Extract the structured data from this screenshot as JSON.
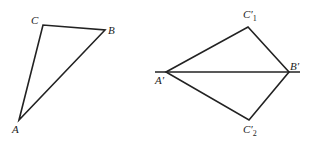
{
  "diagram": {
    "left_triangle": {
      "vertices": {
        "A": {
          "label": "A",
          "x": 19,
          "y": 120
        },
        "B": {
          "label": "B",
          "x": 105,
          "y": 30
        },
        "C": {
          "label": "C",
          "x": 43,
          "y": 25
        }
      }
    },
    "right_figure": {
      "baseline": {
        "x1": 155,
        "y1": 72,
        "x2": 300,
        "y2": 72
      },
      "vertices": {
        "A_prime": {
          "label": "A′",
          "x": 166,
          "y": 72
        },
        "B_prime": {
          "label": "B′",
          "x": 289,
          "y": 72
        },
        "C1_prime": {
          "label": "C′",
          "sub": "1",
          "x": 248,
          "y": 27
        },
        "C2_prime": {
          "label": "C′",
          "sub": "2",
          "x": 249,
          "y": 120
        }
      }
    },
    "stroke_color": "#222222"
  }
}
